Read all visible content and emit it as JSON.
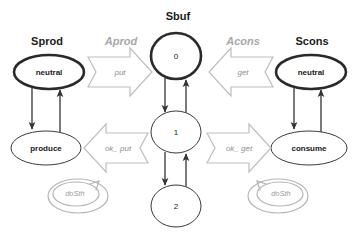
{
  "diagram": {
    "title_row": [
      {
        "id": "sprod",
        "label": "Sprod",
        "style": "bold-black"
      },
      {
        "id": "aprod",
        "label": "Aprod",
        "style": "gray-italic"
      },
      {
        "id": "sbuf",
        "label": "Sbuf",
        "style": "bold-black"
      },
      {
        "id": "acons",
        "label": "Acons",
        "style": "gray-italic"
      },
      {
        "id": "scons",
        "label": "Scons",
        "style": "bold-black"
      }
    ],
    "producer": {
      "title": "Sprod",
      "states": [
        {
          "id": "prod-neutral",
          "label": "neutral",
          "initial": true
        },
        {
          "id": "prod-produce",
          "label": "produce",
          "initial": false
        }
      ],
      "self_loop": {
        "id": "prod-dosth",
        "label": "doSth"
      }
    },
    "buffer": {
      "title": "Sbuf",
      "states": [
        {
          "id": "buf-0",
          "label": "0",
          "initial": true
        },
        {
          "id": "buf-1",
          "label": "1",
          "initial": false
        },
        {
          "id": "buf-2",
          "label": "2",
          "initial": false
        }
      ]
    },
    "consumer": {
      "title": "Scons",
      "states": [
        {
          "id": "cons-neutral",
          "label": "neutral",
          "initial": true
        },
        {
          "id": "cons-consume",
          "label": "consume",
          "initial": false
        }
      ],
      "self_loop": {
        "id": "cons-dosth",
        "label": "doSth"
      }
    },
    "channels": {
      "producer_side": {
        "title": "Aprod",
        "messages": [
          {
            "id": "put",
            "label": "put",
            "direction": "right"
          },
          {
            "id": "ok_put",
            "label": "ok_ put",
            "direction": "left"
          }
        ]
      },
      "consumer_side": {
        "title": "Acons",
        "messages": [
          {
            "id": "get",
            "label": "get",
            "direction": "left"
          },
          {
            "id": "ok_get",
            "label": "ok_ get",
            "direction": "right"
          }
        ]
      }
    },
    "colors": {
      "background": "#ffffff",
      "title_black": "#1a1a1a",
      "title_gray": "#a8a8a8",
      "node_stroke": "#3a3a3a",
      "node_stroke_initial": "#2a2a2a",
      "edge": "#333333",
      "block_arrow_stroke": "#bdbdbd",
      "message_label": "#8f8f8f",
      "loop_stroke": "#b5b5b5"
    }
  }
}
